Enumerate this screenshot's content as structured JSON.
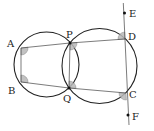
{
  "diagram": {
    "type": "geometry",
    "circles": [
      {
        "name": "left-circle",
        "cx": 46.5,
        "cy": 64.5,
        "r": 32.5
      },
      {
        "name": "right-circle",
        "cx": 99.5,
        "cy": 66,
        "r": 37.5
      }
    ],
    "points": {
      "A": {
        "label": "A",
        "x": 21,
        "y": 48
      },
      "B": {
        "label": "B",
        "x": 21,
        "y": 82
      },
      "P": {
        "label": "P",
        "x": 70,
        "y": 43
      },
      "Q": {
        "label": "Q",
        "x": 69,
        "y": 88
      },
      "D": {
        "label": "D",
        "x": 125,
        "y": 39
      },
      "C": {
        "label": "C",
        "x": 126,
        "y": 93
      },
      "E": {
        "label": "E",
        "x": 124,
        "y": 13
      },
      "F": {
        "label": "F",
        "x": 128,
        "y": 115
      }
    },
    "segments": [
      "AP",
      "PD",
      "BQ",
      "QC",
      "AB",
      "PQ",
      "EF"
    ],
    "marked_angles": [
      "A",
      "B",
      "P",
      "Q",
      "D",
      "C"
    ]
  }
}
